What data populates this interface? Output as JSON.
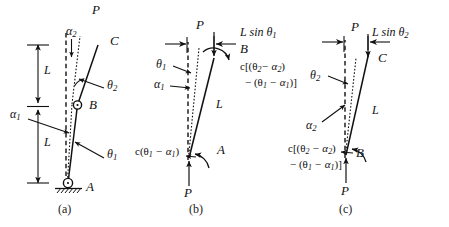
{
  "figure": {
    "panels": [
      {
        "id": "a",
        "caption": "(a)",
        "labels": {
          "load_top": "P",
          "point_c": "C",
          "point_b": "B",
          "point_a": "A",
          "alpha_1": "α",
          "alpha_1_sub": "1",
          "alpha_2": "α",
          "alpha_2_sub": "2",
          "theta_1": "θ",
          "theta_1_sub": "1",
          "theta_2": "θ",
          "theta_2_sub": "2",
          "length_lower": "L",
          "length_upper": "L"
        }
      },
      {
        "id": "b",
        "caption": "(b)",
        "labels": {
          "load_top": "P",
          "load_bottom": "P",
          "point_b": "B",
          "point_a": "A",
          "horizontal_offset": "L sin θ",
          "horizontal_offset_sub": "1",
          "theta_1": "θ",
          "theta_1_sub": "1",
          "alpha_1": "α",
          "alpha_1_sub": "1",
          "length": "L",
          "moment_base": "c(θ",
          "moment_base_sub": "1",
          "moment_base_tail": " − α",
          "moment_base_sub2": "1",
          "moment_base_end": ")",
          "moment_top_line1": "c[(θ",
          "moment_top_line1_sub": "2",
          "moment_top_line1_mid": "− α",
          "moment_top_line1_sub2": "2",
          "moment_top_line1_end": ")",
          "moment_top_line2": "− (θ",
          "moment_top_line2_sub": "1",
          "moment_top_line2_mid": " − α",
          "moment_top_line2_sub2": "1",
          "moment_top_line2_end": ")]"
        }
      },
      {
        "id": "c",
        "caption": "(c)",
        "labels": {
          "load_top": "P",
          "load_bottom": "P",
          "point_c": "C",
          "point_b": "B",
          "horizontal_offset": "L sin θ",
          "horizontal_offset_sub": "2",
          "theta_2": "θ",
          "theta_2_sub": "2",
          "alpha_2": "α",
          "alpha_2_sub": "2",
          "length": "L",
          "moment_line1": "c[(θ",
          "moment_line1_sub": "2",
          "moment_line1_mid": " − α",
          "moment_line1_sub2": "2",
          "moment_line1_end": ")",
          "moment_line2": "− (θ",
          "moment_line2_sub": "1",
          "moment_line2_mid": " − α",
          "moment_line2_sub2": "1",
          "moment_line2_end": ")]"
        }
      }
    ],
    "colors": {
      "ink": "#111111",
      "background": "#ffffff"
    }
  }
}
